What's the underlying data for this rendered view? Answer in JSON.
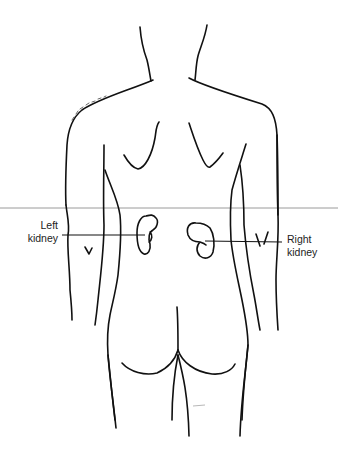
{
  "figure": {
    "view": "posterior",
    "colors": {
      "outline": "#111111",
      "divider": "#9a9a9a",
      "background": "#ffffff"
    }
  },
  "labels": {
    "left_kidney": {
      "line1": "Left",
      "line2": "kidney"
    },
    "right_kidney": {
      "line1": "Right",
      "line2": "kidney"
    }
  }
}
